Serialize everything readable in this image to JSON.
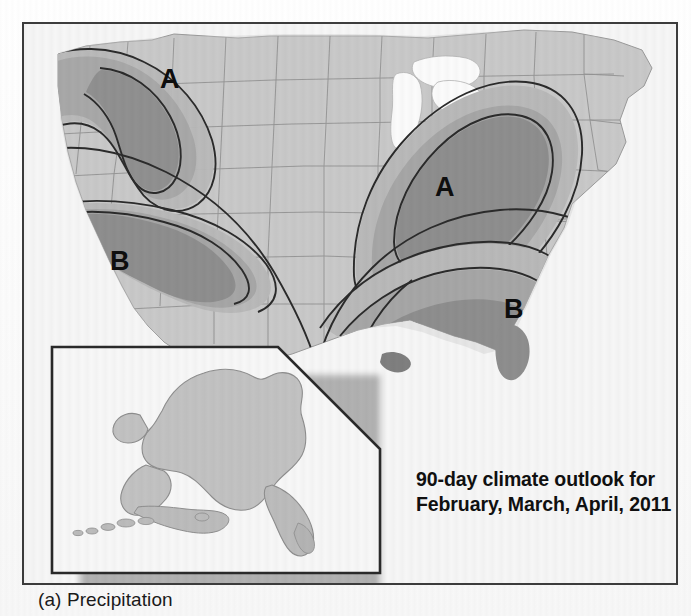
{
  "figure": {
    "caption": "(a) Precipitation",
    "annotation_line1": "90-day climate outlook for",
    "annotation_line2": "February, March, April, 2011",
    "frame_border_color": "#3c3c3c",
    "page_background": "#fdfdfd"
  },
  "map": {
    "title_implied": "CPC 90-day precipitation outlook, contiguous United States",
    "base_land_color": "#c9c9c9",
    "ocean_color": "#f6f6f6",
    "lake_color": "#fbfbfb",
    "state_border_color": "#8f8f8f",
    "contour_color": "#2b2b2b",
    "shade_levels": [
      {
        "name": "level-1",
        "color": "#b9b9b9",
        "meaning": "slight tilt in odds"
      },
      {
        "name": "level-2",
        "color": "#a6a6a6",
        "meaning": "moderate tilt in odds"
      },
      {
        "name": "level-3",
        "color": "#8e8e8e",
        "meaning": "strong tilt in odds"
      }
    ],
    "labels": [
      {
        "id": "label-a-northwest",
        "text": "A",
        "meaning": "above normal precipitation",
        "x": 157,
        "y": 56
      },
      {
        "id": "label-b-southwest",
        "text": "B",
        "meaning": "below normal precipitation",
        "x": 107,
        "y": 238
      },
      {
        "id": "label-a-midwest",
        "text": "A",
        "meaning": "above normal precipitation",
        "x": 432,
        "y": 164
      },
      {
        "id": "label-b-southeast",
        "text": "B",
        "meaning": "below normal precipitation",
        "x": 501,
        "y": 286
      }
    ],
    "regions": [
      {
        "id": "region-a-northwest",
        "label": "A",
        "area": "Pacific Northwest / Northern Rockies",
        "bands": 3
      },
      {
        "id": "region-b-southwest",
        "label": "B",
        "area": "Southwest / Southern California / Arizona / New Mexico",
        "bands": 3
      },
      {
        "id": "region-a-midwest",
        "label": "A",
        "area": "Ohio Valley / Great Lakes / Midwest",
        "bands": 3
      },
      {
        "id": "region-b-southeast",
        "label": "B",
        "area": "Gulf Coast / Southeast / Florida",
        "bands": 3
      }
    ]
  },
  "inset": {
    "name": "alaska-inset",
    "region": "Alaska",
    "border_color": "#2a2a2a",
    "background": "#f7f7f7",
    "land_color": "#c2c2c2",
    "corner_style": "beveled-top-right"
  }
}
